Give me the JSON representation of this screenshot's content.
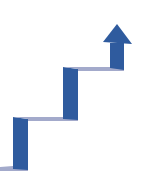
{
  "illustration": {
    "subject": "growth-staircase-arrow",
    "colors": {
      "riser": "#2F5B9E",
      "riser_dark": "#27508F",
      "tread": "#A3AACB",
      "background": "#FFFFFF"
    },
    "steps": 3,
    "arrow_direction": "up"
  }
}
